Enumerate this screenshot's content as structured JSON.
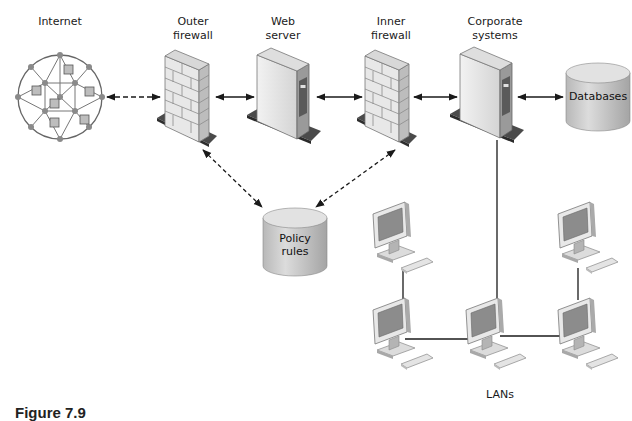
{
  "labels": {
    "internet": "Internet",
    "outer_firewall": "Outer\nfirewall",
    "web_server": "Web\nserver",
    "inner_firewall": "Inner\nfirewall",
    "corporate_systems": "Corporate\nsystems",
    "databases": "Databases",
    "policy_rules": "Policy\nrules",
    "lans": "LANs"
  },
  "caption": "Figure 7.9",
  "icons": {
    "internet": "network-globe-icon",
    "firewall": "brick-wall-icon",
    "server": "tower-server-icon",
    "database": "cylinder-database-icon",
    "workstation": "desktop-computer-icon"
  },
  "colors": {
    "line": "#1a1a1a",
    "device_light": "#e6e6e6",
    "device_mid": "#c8c8c8",
    "device_dark": "#6e6e6e",
    "base": "#555555",
    "screen": "#8a8a8a"
  }
}
